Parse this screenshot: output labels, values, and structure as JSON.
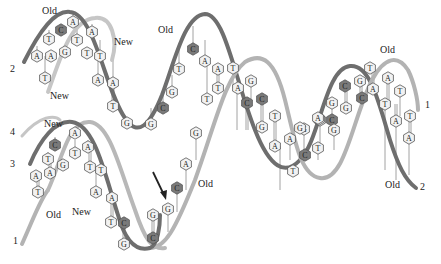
{
  "figure": {
    "type": "DNA replication diagram",
    "colors": {
      "old_strand_dark": "#6b6b6b",
      "old_strand_light": "#b0b0b0",
      "new_strand": "#c4c4c4",
      "base_fill": "#f2f2f2",
      "base_fill_dark": "#7a7a7a",
      "base_stroke": "#555555",
      "arrow": "#222222"
    },
    "labels": [
      {
        "id": "old-top-left",
        "text": "Old",
        "x": 42,
        "y": 14
      },
      {
        "id": "new-top-1",
        "text": "New",
        "x": 114,
        "y": 45
      },
      {
        "id": "new-left-1",
        "text": "New",
        "x": 50,
        "y": 99
      },
      {
        "id": "old-top-mid",
        "text": "Old",
        "x": 158,
        "y": 33
      },
      {
        "id": "new-left-2",
        "text": "New",
        "x": 44,
        "y": 127
      },
      {
        "id": "old-left-bottom",
        "text": "Old",
        "x": 46,
        "y": 218
      },
      {
        "id": "new-bottom-mid",
        "text": "New",
        "x": 72,
        "y": 215
      },
      {
        "id": "old-bottom-mid",
        "text": "Old",
        "x": 198,
        "y": 187
      },
      {
        "id": "old-top-right",
        "text": "Old",
        "x": 380,
        "y": 53
      },
      {
        "id": "old-bottom-right",
        "text": "Old",
        "x": 385,
        "y": 188
      }
    ],
    "strand_numbers": [
      {
        "id": "strand-2-left",
        "text": "2",
        "x": 10,
        "y": 72
      },
      {
        "id": "strand-4-left",
        "text": "4",
        "x": 10,
        "y": 135
      },
      {
        "id": "strand-3-left",
        "text": "3",
        "x": 10,
        "y": 167
      },
      {
        "id": "strand-1-left",
        "text": "1",
        "x": 13,
        "y": 244
      },
      {
        "id": "strand-1-right",
        "text": "1",
        "x": 425,
        "y": 108
      },
      {
        "id": "strand-2-right",
        "text": "2",
        "x": 420,
        "y": 190
      }
    ],
    "bases": [
      {
        "b": "A",
        "x": 73,
        "y": 22,
        "dark": false
      },
      {
        "b": "C",
        "x": 61,
        "y": 30,
        "dark": true
      },
      {
        "b": "T",
        "x": 49,
        "y": 39,
        "dark": false
      },
      {
        "b": "T",
        "x": 77,
        "y": 40,
        "dark": false
      },
      {
        "b": "G",
        "x": 65,
        "y": 52,
        "dark": false
      },
      {
        "b": "A",
        "x": 92,
        "y": 32,
        "dark": false
      },
      {
        "b": "A",
        "x": 37,
        "y": 56,
        "dark": false
      },
      {
        "b": "A",
        "x": 51,
        "y": 56,
        "dark": false
      },
      {
        "b": "T",
        "x": 87,
        "y": 53,
        "dark": false
      },
      {
        "b": "T",
        "x": 100,
        "y": 56,
        "dark": false
      },
      {
        "b": "T",
        "x": 45,
        "y": 78,
        "dark": false
      },
      {
        "b": "A",
        "x": 98,
        "y": 80,
        "dark": false
      },
      {
        "b": "A",
        "x": 113,
        "y": 83,
        "dark": false
      },
      {
        "b": "T",
        "x": 113,
        "y": 106,
        "dark": false
      },
      {
        "b": "G",
        "x": 127,
        "y": 123,
        "dark": false
      },
      {
        "b": "G",
        "x": 151,
        "y": 124,
        "dark": false
      },
      {
        "b": "C",
        "x": 163,
        "y": 108,
        "dark": true
      },
      {
        "b": "G",
        "x": 172,
        "y": 92,
        "dark": false
      },
      {
        "b": "T",
        "x": 179,
        "y": 69,
        "dark": false
      },
      {
        "b": "C",
        "x": 193,
        "y": 49,
        "dark": true
      },
      {
        "b": "A",
        "x": 205,
        "y": 61,
        "dark": false
      },
      {
        "b": "A",
        "x": 218,
        "y": 69,
        "dark": false
      },
      {
        "b": "T",
        "x": 233,
        "y": 68,
        "dark": false
      },
      {
        "b": "T",
        "x": 218,
        "y": 88,
        "dark": false
      },
      {
        "b": "T",
        "x": 207,
        "y": 99,
        "dark": false
      },
      {
        "b": "A",
        "x": 238,
        "y": 88,
        "dark": false
      },
      {
        "b": "G",
        "x": 251,
        "y": 81,
        "dark": false
      },
      {
        "b": "C",
        "x": 247,
        "y": 103,
        "dark": true
      },
      {
        "b": "C",
        "x": 262,
        "y": 99,
        "dark": true
      },
      {
        "b": "T",
        "x": 275,
        "y": 116,
        "dark": false
      },
      {
        "b": "G",
        "x": 262,
        "y": 127,
        "dark": false
      },
      {
        "b": "A",
        "x": 275,
        "y": 146,
        "dark": false
      },
      {
        "b": "A",
        "x": 290,
        "y": 139,
        "dark": false
      },
      {
        "b": "G",
        "x": 304,
        "y": 129,
        "dark": false
      },
      {
        "b": "C",
        "x": 305,
        "y": 155,
        "dark": true
      },
      {
        "b": "T",
        "x": 293,
        "y": 171,
        "dark": false
      },
      {
        "b": "A",
        "x": 320,
        "y": 120,
        "dark": false
      },
      {
        "b": "T",
        "x": 318,
        "y": 148,
        "dark": false
      },
      {
        "b": "G",
        "x": 300,
        "y": 128,
        "dark": false
      },
      {
        "b": "A",
        "x": 319,
        "y": 119,
        "dark": false
      },
      {
        "b": "G",
        "x": 332,
        "y": 103,
        "dark": false
      },
      {
        "b": "C",
        "x": 332,
        "y": 120,
        "dark": true
      },
      {
        "b": "A",
        "x": 318,
        "y": 118,
        "dark": false
      },
      {
        "b": "G",
        "x": 334,
        "y": 130,
        "dark": false
      },
      {
        "b": "C",
        "x": 345,
        "y": 86,
        "dark": true
      },
      {
        "b": "G",
        "x": 360,
        "y": 81,
        "dark": false
      },
      {
        "b": "C",
        "x": 362,
        "y": 98,
        "dark": true
      },
      {
        "b": "G",
        "x": 346,
        "y": 108,
        "dark": false
      },
      {
        "b": "T",
        "x": 370,
        "y": 68,
        "dark": false
      },
      {
        "b": "A",
        "x": 373,
        "y": 89,
        "dark": false
      },
      {
        "b": "A",
        "x": 388,
        "y": 78,
        "dark": false
      },
      {
        "b": "T",
        "x": 385,
        "y": 104,
        "dark": false
      },
      {
        "b": "T",
        "x": 400,
        "y": 91,
        "dark": false
      },
      {
        "b": "A",
        "x": 396,
        "y": 121,
        "dark": false
      },
      {
        "b": "T",
        "x": 410,
        "y": 116,
        "dark": false
      },
      {
        "b": "A",
        "x": 409,
        "y": 138,
        "dark": false
      },
      {
        "b": "A",
        "x": 75,
        "y": 133,
        "dark": false
      },
      {
        "b": "C",
        "x": 55,
        "y": 145,
        "dark": true
      },
      {
        "b": "A",
        "x": 88,
        "y": 147,
        "dark": false
      },
      {
        "b": "T",
        "x": 48,
        "y": 159,
        "dark": false
      },
      {
        "b": "T",
        "x": 75,
        "y": 153,
        "dark": false
      },
      {
        "b": "A",
        "x": 50,
        "y": 173,
        "dark": false
      },
      {
        "b": "G",
        "x": 63,
        "y": 165,
        "dark": false
      },
      {
        "b": "T",
        "x": 90,
        "y": 167,
        "dark": false
      },
      {
        "b": "T",
        "x": 101,
        "y": 170,
        "dark": false
      },
      {
        "b": "A",
        "x": 36,
        "y": 176,
        "dark": false
      },
      {
        "b": "T",
        "x": 38,
        "y": 192,
        "dark": false
      },
      {
        "b": "A",
        "x": 96,
        "y": 192,
        "dark": false
      },
      {
        "b": "A",
        "x": 112,
        "y": 198,
        "dark": false
      },
      {
        "b": "T",
        "x": 111,
        "y": 222,
        "dark": false
      },
      {
        "b": "C",
        "x": 124,
        "y": 223,
        "dark": true
      },
      {
        "b": "G",
        "x": 124,
        "y": 244,
        "dark": false
      },
      {
        "b": "G",
        "x": 153,
        "y": 215,
        "dark": false
      },
      {
        "b": "C",
        "x": 153,
        "y": 238,
        "dark": true
      },
      {
        "b": "G",
        "x": 168,
        "y": 209,
        "dark": false
      },
      {
        "b": "C",
        "x": 177,
        "y": 188,
        "dark": true
      },
      {
        "b": "A",
        "x": 186,
        "y": 164,
        "dark": false
      },
      {
        "b": "G",
        "x": 196,
        "y": 133,
        "dark": false
      }
    ],
    "arrow": {
      "x1": 153,
      "y1": 172,
      "x2": 165,
      "y2": 198
    }
  }
}
